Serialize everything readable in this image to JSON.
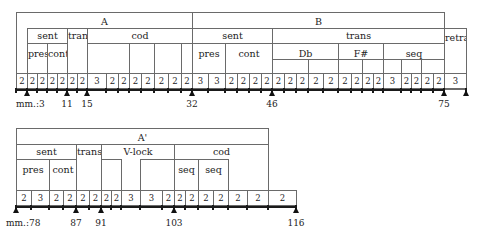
{
  "top_row": {
    "boxes": [
      {
        "name": "section-a",
        "label": "A",
        "x": 16,
        "y": 12,
        "w": 176,
        "h": 78,
        "ly": 3
      },
      {
        "name": "section-b",
        "label": "B",
        "x": 192,
        "y": 12,
        "w": 252,
        "h": 78,
        "ly": 3
      },
      {
        "name": "a-sent",
        "label": "sent",
        "x": 27,
        "y": 28,
        "w": 40,
        "h": 62,
        "ly": 1
      },
      {
        "name": "a-pres",
        "label": "pres",
        "x": 27,
        "y": 43,
        "w": 20,
        "h": 47,
        "ly": 4
      },
      {
        "name": "a-cont",
        "label": "cont",
        "x": 47,
        "y": 43,
        "w": 20,
        "h": 47,
        "ly": 4
      },
      {
        "name": "a-trans",
        "label": "trans",
        "x": 67,
        "y": 28,
        "w": 20,
        "h": 62,
        "ly": 1
      },
      {
        "name": "a-cod",
        "label": "cod",
        "x": 87,
        "y": 28,
        "w": 105,
        "h": 62,
        "ly": 1
      },
      {
        "name": "a-cod-1",
        "label": "",
        "x": 87,
        "y": 43,
        "w": 42,
        "h": 47,
        "ly": 4
      },
      {
        "name": "a-cod-2",
        "label": "",
        "x": 129,
        "y": 43,
        "w": 25,
        "h": 47,
        "ly": 4
      },
      {
        "name": "a-cod-3",
        "label": "",
        "x": 154,
        "y": 43,
        "w": 27,
        "h": 47,
        "ly": 4
      },
      {
        "name": "a-cod-4",
        "label": "",
        "x": 181,
        "y": 43,
        "w": 11,
        "h": 47,
        "ly": 4
      },
      {
        "name": "b-sent",
        "label": "sent",
        "x": 192,
        "y": 28,
        "w": 80,
        "h": 62,
        "ly": 1
      },
      {
        "name": "b-pres",
        "label": "pres",
        "x": 192,
        "y": 43,
        "w": 33,
        "h": 47,
        "ly": 4
      },
      {
        "name": "b-cont",
        "label": "cont",
        "x": 225,
        "y": 43,
        "w": 47,
        "h": 47,
        "ly": 4
      },
      {
        "name": "b-trans",
        "label": "trans",
        "x": 272,
        "y": 28,
        "w": 172,
        "h": 62,
        "ly": 1
      },
      {
        "name": "b-db",
        "label": "Db",
        "x": 272,
        "y": 43,
        "w": 66,
        "h": 47,
        "ly": 4
      },
      {
        "name": "b-db-1",
        "label": "",
        "x": 272,
        "y": 59,
        "w": 36,
        "h": 31,
        "ly": 0
      },
      {
        "name": "b-db-2",
        "label": "",
        "x": 308,
        "y": 59,
        "w": 30,
        "h": 31,
        "ly": 0
      },
      {
        "name": "b-fsharp",
        "label": "F#",
        "x": 338,
        "y": 43,
        "w": 45,
        "h": 47,
        "ly": 4
      },
      {
        "name": "b-fsharp-1",
        "label": "",
        "x": 338,
        "y": 59,
        "w": 24,
        "h": 31,
        "ly": 0
      },
      {
        "name": "b-fsharp-2",
        "label": "",
        "x": 362,
        "y": 59,
        "w": 21,
        "h": 31,
        "ly": 0
      },
      {
        "name": "b-seq",
        "label": "seq",
        "x": 383,
        "y": 43,
        "w": 61,
        "h": 47,
        "ly": 4
      },
      {
        "name": "b-seq-1",
        "label": "",
        "x": 383,
        "y": 59,
        "w": 18,
        "h": 31,
        "ly": 0
      },
      {
        "name": "b-seq-2",
        "label": "",
        "x": 401,
        "y": 59,
        "w": 20,
        "h": 31,
        "ly": 0
      },
      {
        "name": "b-seq-3",
        "label": "",
        "x": 421,
        "y": 59,
        "w": 23,
        "h": 31,
        "ly": 0
      },
      {
        "name": "retra",
        "label": "retra",
        "x": 444,
        "y": 28,
        "w": 22,
        "h": 62,
        "ly": 3
      }
    ],
    "cells_y": 73,
    "cells_h": 16,
    "cells": [
      {
        "x": 16,
        "w": 11,
        "v": "2"
      },
      {
        "x": 27,
        "w": 10,
        "v": "2"
      },
      {
        "x": 37,
        "w": 10,
        "v": "2"
      },
      {
        "x": 47,
        "w": 10,
        "v": "2"
      },
      {
        "x": 57,
        "w": 10,
        "v": "2"
      },
      {
        "x": 67,
        "w": 10,
        "v": "2"
      },
      {
        "x": 77,
        "w": 10,
        "v": "2"
      },
      {
        "x": 87,
        "w": 19,
        "v": "3"
      },
      {
        "x": 106,
        "w": 12,
        "v": "2"
      },
      {
        "x": 118,
        "w": 11,
        "v": "2"
      },
      {
        "x": 129,
        "w": 12,
        "v": "2"
      },
      {
        "x": 141,
        "w": 13,
        "v": "2"
      },
      {
        "x": 154,
        "w": 14,
        "v": "2"
      },
      {
        "x": 168,
        "w": 13,
        "v": "2"
      },
      {
        "x": 181,
        "w": 11,
        "v": "2"
      },
      {
        "x": 192,
        "w": 16,
        "v": "3"
      },
      {
        "x": 208,
        "w": 17,
        "v": "3"
      },
      {
        "x": 225,
        "w": 12,
        "v": "2"
      },
      {
        "x": 237,
        "w": 12,
        "v": "2"
      },
      {
        "x": 249,
        "w": 12,
        "v": "2"
      },
      {
        "x": 261,
        "w": 11,
        "v": "2"
      },
      {
        "x": 272,
        "w": 12,
        "v": "2"
      },
      {
        "x": 284,
        "w": 12,
        "v": "2"
      },
      {
        "x": 296,
        "w": 12,
        "v": "2"
      },
      {
        "x": 308,
        "w": 15,
        "v": "2"
      },
      {
        "x": 323,
        "w": 15,
        "v": "2"
      },
      {
        "x": 338,
        "w": 13,
        "v": "2"
      },
      {
        "x": 351,
        "w": 11,
        "v": "2"
      },
      {
        "x": 362,
        "w": 11,
        "v": "2"
      },
      {
        "x": 373,
        "w": 10,
        "v": "2"
      },
      {
        "x": 383,
        "w": 18,
        "v": "3"
      },
      {
        "x": 401,
        "w": 10,
        "v": "2"
      },
      {
        "x": 411,
        "w": 10,
        "v": "2"
      },
      {
        "x": 421,
        "w": 12,
        "v": "2"
      },
      {
        "x": 433,
        "w": 11,
        "v": "2"
      },
      {
        "x": 444,
        "w": 22,
        "v": "3"
      }
    ],
    "axis": {
      "x": 16,
      "y": 89,
      "w": 428
    },
    "markers": [
      {
        "x": 27,
        "label": "mm.:3",
        "align": "left",
        "lx": 16
      },
      {
        "x": 67,
        "label": "11"
      },
      {
        "x": 87,
        "label": "15"
      },
      {
        "x": 192,
        "label": "32"
      },
      {
        "x": 272,
        "label": "46"
      },
      {
        "x": 444,
        "label": "75"
      },
      {
        "x": 466,
        "label": ""
      }
    ],
    "label_y": 99
  },
  "bottom_row": {
    "boxes": [
      {
        "name": "section-a-prime",
        "label": "A'",
        "x": 16,
        "y": 128,
        "w": 252,
        "h": 79,
        "ly": 3
      },
      {
        "name": "ap-sent",
        "label": "sent",
        "x": 16,
        "y": 144,
        "w": 60,
        "h": 63,
        "ly": 1
      },
      {
        "name": "ap-pres",
        "label": "pres",
        "x": 16,
        "y": 159,
        "w": 33,
        "h": 48,
        "ly": 4
      },
      {
        "name": "ap-cont",
        "label": "cont",
        "x": 49,
        "y": 159,
        "w": 27,
        "h": 48,
        "ly": 4
      },
      {
        "name": "ap-trans",
        "label": "trans",
        "x": 76,
        "y": 144,
        "w": 25,
        "h": 63,
        "ly": 1
      },
      {
        "name": "ap-vlock",
        "label": "V-lock",
        "x": 101,
        "y": 144,
        "w": 73,
        "h": 63,
        "ly": 1
      },
      {
        "name": "ap-vlock-1",
        "label": "",
        "x": 101,
        "y": 159,
        "w": 20,
        "h": 48,
        "ly": 0
      },
      {
        "name": "ap-vlock-2",
        "label": "",
        "x": 140,
        "y": 159,
        "w": 34,
        "h": 48,
        "ly": 0
      },
      {
        "name": "ap-cod",
        "label": "cod",
        "x": 174,
        "y": 144,
        "w": 94,
        "h": 63,
        "ly": 1
      },
      {
        "name": "ap-seq-1",
        "label": "seq",
        "x": 174,
        "y": 159,
        "w": 24,
        "h": 48,
        "ly": 4
      },
      {
        "name": "ap-seq-2",
        "label": "seq",
        "x": 198,
        "y": 159,
        "w": 30,
        "h": 48,
        "ly": 4
      }
    ],
    "cells_y": 190,
    "cells_h": 16,
    "cells": [
      {
        "x": 16,
        "w": 15,
        "v": "2"
      },
      {
        "x": 31,
        "w": 18,
        "v": "3"
      },
      {
        "x": 49,
        "w": 14,
        "v": "2"
      },
      {
        "x": 63,
        "w": 13,
        "v": "2"
      },
      {
        "x": 76,
        "w": 13,
        "v": "2"
      },
      {
        "x": 89,
        "w": 12,
        "v": "2"
      },
      {
        "x": 101,
        "w": 10,
        "v": "2"
      },
      {
        "x": 111,
        "w": 10,
        "v": "2"
      },
      {
        "x": 121,
        "w": 19,
        "v": "3"
      },
      {
        "x": 140,
        "w": 22,
        "v": "3"
      },
      {
        "x": 162,
        "w": 12,
        "v": "2"
      },
      {
        "x": 174,
        "w": 11,
        "v": "2"
      },
      {
        "x": 185,
        "w": 13,
        "v": "2"
      },
      {
        "x": 198,
        "w": 15,
        "v": "2"
      },
      {
        "x": 213,
        "w": 15,
        "v": "2"
      },
      {
        "x": 228,
        "w": 19,
        "v": "2"
      },
      {
        "x": 247,
        "w": 21,
        "v": "2"
      },
      {
        "x": 268,
        "w": 28,
        "v": "2"
      }
    ],
    "axis": {
      "x": 16,
      "y": 206,
      "w": 280
    },
    "markers": [
      {
        "x": 16,
        "label": "mm.:78",
        "align": "left",
        "lx": 6
      },
      {
        "x": 76,
        "label": "87"
      },
      {
        "x": 101,
        "label": "91"
      },
      {
        "x": 174,
        "label": "103"
      },
      {
        "x": 296,
        "label": "116"
      }
    ],
    "label_y": 218
  }
}
